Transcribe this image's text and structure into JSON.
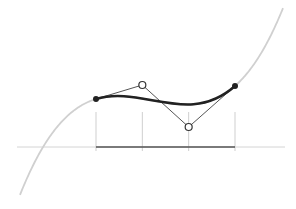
{
  "diagram": {
    "underlying_curve": {
      "type": "cubic-polynomial",
      "color": "#d0d0d0"
    },
    "bezier_segment": {
      "type": "cubic-bezier",
      "color": "#222222",
      "control_points": [
        {
          "id": "P0",
          "kind": "endpoint",
          "marker": "filled-dot"
        },
        {
          "id": "P1",
          "kind": "control",
          "marker": "hollow-circle"
        },
        {
          "id": "P2",
          "kind": "control",
          "marker": "hollow-circle"
        },
        {
          "id": "P3",
          "kind": "endpoint",
          "marker": "filled-dot"
        }
      ]
    },
    "control_polygon": {
      "segments": 3,
      "color": "#555555"
    },
    "interval": {
      "subdivisions": 3,
      "division_lines": 4
    },
    "axis": {
      "orientation": "horizontal",
      "color": "#d4d4d4"
    }
  }
}
